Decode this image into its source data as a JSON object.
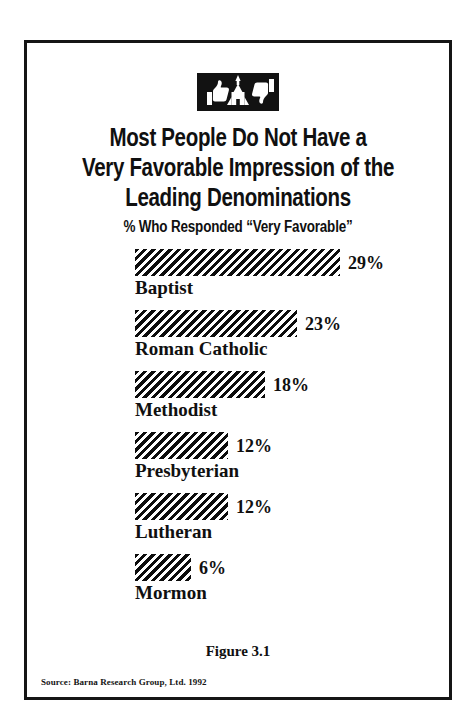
{
  "figure": {
    "icon_name": "thumbs-up-church-thumbs-down-icon",
    "title_line_1": "Most People Do Not Have a",
    "title_line_2": "Very Favorable Impression of the",
    "title_line_3": "Leading Denominations",
    "subtitle": "% Who Responded “Very Favorable”",
    "caption": "Figure 3.1",
    "source": "Source: Barna Research Group, Ltd. 1992",
    "frame_color": "#151515",
    "bar_color": "#0d0d0d",
    "background_color": "#ffffff"
  },
  "chart_data": {
    "type": "bar",
    "orientation": "horizontal",
    "title": "Most People Do Not Have a Very Favorable Impression of the Leading Denominations",
    "subtitle": "% Who Responded “Very Favorable”",
    "xlabel": "",
    "ylabel": "",
    "xlim": [
      0,
      29
    ],
    "grid": false,
    "legend": "none",
    "categories": [
      "Baptist",
      "Roman Catholic",
      "Methodist",
      "Presbyterian",
      "Lutheran",
      "Mormon"
    ],
    "values": [
      29,
      23,
      18,
      12,
      12,
      6
    ],
    "value_labels": [
      "29%",
      "23%",
      "18%",
      "12%",
      "12%",
      "6%"
    ],
    "units": "percent",
    "bars": [
      {
        "label": "Baptist",
        "value": 29,
        "value_label": "29%",
        "px_width": 205
      },
      {
        "label": "Roman Catholic",
        "value": 23,
        "value_label": "23%",
        "px_width": 162
      },
      {
        "label": "Methodist",
        "value": 18,
        "value_label": "18%",
        "px_width": 130
      },
      {
        "label": "Presbyterian",
        "value": 12,
        "value_label": "12%",
        "px_width": 93
      },
      {
        "label": "Lutheran",
        "value": 12,
        "value_label": "12%",
        "px_width": 93
      },
      {
        "label": "Mormon",
        "value": 6,
        "value_label": "6%",
        "px_width": 56
      }
    ]
  }
}
